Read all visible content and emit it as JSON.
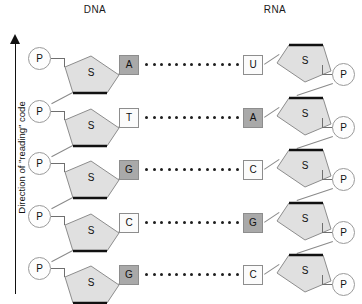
{
  "headers": {
    "left": "DNA",
    "right": "RNA"
  },
  "axis": {
    "label": "Direction of \"reading\" code",
    "arrow_direction": "up"
  },
  "glyphs": {
    "phosphate": "P",
    "sugar": "S"
  },
  "colors": {
    "purine_fill": "#a9a9a9",
    "pyrimidine_fill": "#fbfbfb",
    "sugar_fill": "#e0e0e0",
    "stroke": "#8d8d8d",
    "bond_dot": "#1d1d1d"
  },
  "pairs": [
    {
      "dna_base": "A",
      "dna_type": "purine",
      "rna_base": "U",
      "rna_type": "pyrimidine"
    },
    {
      "dna_base": "T",
      "dna_type": "pyrimidine",
      "rna_base": "A",
      "rna_type": "purine"
    },
    {
      "dna_base": "G",
      "dna_type": "purine",
      "rna_base": "C",
      "rna_type": "pyrimidine"
    },
    {
      "dna_base": "C",
      "dna_type": "pyrimidine",
      "rna_base": "G",
      "rna_type": "purine"
    },
    {
      "dna_base": "G",
      "dna_type": "purine",
      "rna_base": "C",
      "rna_type": "pyrimidine"
    }
  ],
  "hbond_dot_count": 13
}
